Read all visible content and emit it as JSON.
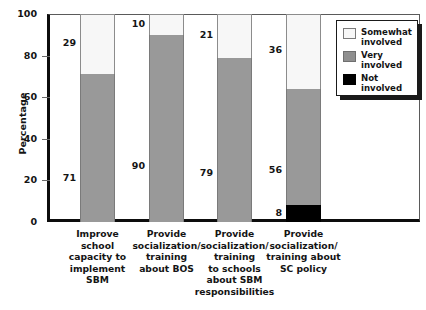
{
  "chart_data": {
    "type": "bar",
    "subtype": "stacked-bar-100",
    "title": "",
    "xlabel": "",
    "ylabel": "Percentage",
    "ylim": [
      0,
      100
    ],
    "yticks": [
      0,
      20,
      40,
      60,
      80,
      100
    ],
    "ytick_labels": [
      "0",
      "20",
      "40",
      "60",
      "80",
      "100"
    ],
    "grid": false,
    "legend_position": "top-right",
    "categories": [
      "Improve school capacity to implement SBM",
      "Provide socialization/ training about BOS",
      "Provide socialization/ training to schools about SBM responsibilities",
      "Provide socialization/ training about SC policy"
    ],
    "category_lines": [
      [
        "Improve",
        "school",
        "capacity to",
        "implement",
        "SBM"
      ],
      [
        "Provide",
        "socialization/",
        "training",
        "about BOS"
      ],
      [
        "Provide",
        "socialization/",
        "training",
        "to schools",
        "about SBM",
        "responsibilities"
      ],
      [
        "Provide",
        "socialization/",
        "training about",
        "SC policy"
      ]
    ],
    "series": [
      {
        "name": "Not involved",
        "color": "#000000",
        "values": [
          0,
          0,
          0,
          8
        ],
        "labels": [
          "",
          "",
          "",
          "8"
        ]
      },
      {
        "name": "Very involved",
        "color": "#999999",
        "values": [
          71,
          90,
          79,
          56
        ],
        "labels": [
          "71",
          "90",
          "79",
          "56"
        ]
      },
      {
        "name": "Somewhat involved",
        "color": "#f7f7f7",
        "values": [
          29,
          10,
          21,
          36
        ],
        "labels": [
          "29",
          "10",
          "21",
          "36"
        ]
      }
    ]
  },
  "legend": {
    "items": [
      {
        "label_line1": "Somewhat",
        "label_line2": "involved",
        "swatch": "light"
      },
      {
        "label_line1": "Very",
        "label_line2": "involved",
        "swatch": "gray"
      },
      {
        "label_line1": "Not",
        "label_line2": "involved",
        "swatch": "black"
      }
    ]
  },
  "axis": {
    "y_title": "Percentage"
  }
}
